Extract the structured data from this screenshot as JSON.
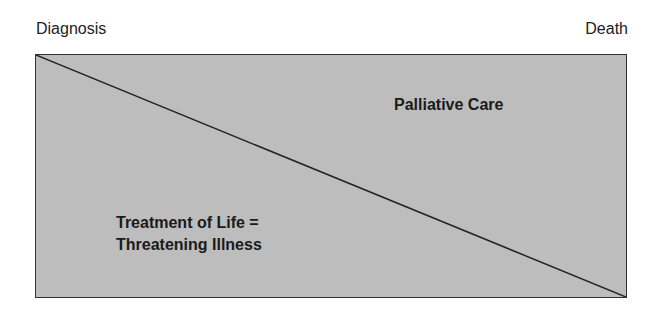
{
  "diagram": {
    "timeline": {
      "start_label": "Diagnosis",
      "end_label": "Death"
    },
    "regions": {
      "upper_right": {
        "label": "Palliative Care"
      },
      "lower_left": {
        "line1": "Treatment of Life =",
        "line2": "Threatening Illness"
      }
    },
    "colors": {
      "fill": "#bdbdbd",
      "border": "#333333",
      "diagonal": "#222222",
      "text": "#1a1a1a"
    }
  }
}
